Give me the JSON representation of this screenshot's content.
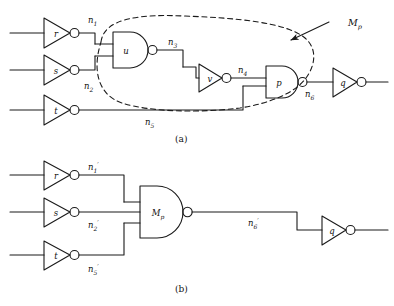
{
  "figure": {
    "panels": [
      {
        "caption": "(a)",
        "gates": [
          {
            "name": "inverter-r",
            "label": "r",
            "type": "inverter"
          },
          {
            "name": "inverter-s",
            "label": "s",
            "type": "inverter"
          },
          {
            "name": "inverter-t",
            "label": "t",
            "type": "inverter"
          },
          {
            "name": "nand-u",
            "label": "u",
            "type": "nand2"
          },
          {
            "name": "inverter-v",
            "label": "v",
            "type": "inverter"
          },
          {
            "name": "nand-p",
            "label": "p",
            "type": "nand2"
          },
          {
            "name": "inverter-q",
            "label": "q",
            "type": "inverter"
          }
        ],
        "nets": [
          {
            "name": "net-n1",
            "label": "n",
            "sub": "1"
          },
          {
            "name": "net-n2",
            "label": "n",
            "sub": "2"
          },
          {
            "name": "net-n3",
            "label": "n",
            "sub": "3"
          },
          {
            "name": "net-n4",
            "label": "n",
            "sub": "4"
          },
          {
            "name": "net-n5",
            "label": "n",
            "sub": "5"
          },
          {
            "name": "net-n6",
            "label": "n",
            "sub": "6"
          }
        ],
        "annotation": {
          "name": "macro-label-mp",
          "label": "M",
          "sub": "p"
        }
      },
      {
        "caption": "(b)",
        "gates": [
          {
            "name": "inverter-r",
            "label": "r",
            "type": "inverter"
          },
          {
            "name": "inverter-s",
            "label": "s",
            "type": "inverter"
          },
          {
            "name": "inverter-t",
            "label": "t",
            "type": "inverter"
          },
          {
            "name": "nand-mp",
            "label": "M",
            "sub": "p",
            "type": "nand3"
          },
          {
            "name": "inverter-q",
            "label": "q",
            "type": "inverter"
          }
        ],
        "nets": [
          {
            "name": "net-n1-prime",
            "label": "n",
            "sub": "1",
            "prime": "′"
          },
          {
            "name": "net-n2-prime",
            "label": "n",
            "sub": "2",
            "prime": "′"
          },
          {
            "name": "net-n5-prime",
            "label": "n",
            "sub": "5",
            "prime": "′"
          },
          {
            "name": "net-n6-prime",
            "label": "n",
            "sub": "6",
            "prime": "′"
          }
        ]
      }
    ]
  },
  "style": {
    "line_color": "#1a1a1a",
    "text_color": "#111111",
    "background": "#ffffff"
  }
}
